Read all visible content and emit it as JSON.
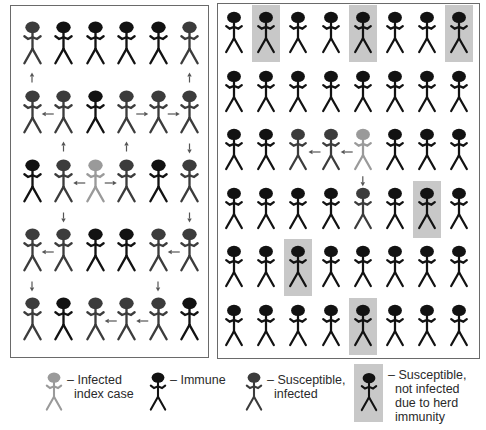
{
  "colors": {
    "immune": "#121212",
    "infected": "#3c3c3c",
    "index": "#9a9a9a",
    "shade": "#c8c8c8",
    "arrow": "#555555"
  },
  "left_panel": {
    "title": "Without herd immunity",
    "cols": 6,
    "rows": 5,
    "grid": [
      [
        "infected",
        "immune",
        "immune",
        "immune",
        "immune",
        "infected"
      ],
      [
        "infected",
        "infected",
        "immune",
        "infected",
        "infected",
        "infected"
      ],
      [
        "immune",
        "infected",
        "index",
        "infected",
        "immune",
        "infected"
      ],
      [
        "infected",
        "infected",
        "immune",
        "immune",
        "infected",
        "infected"
      ],
      [
        "infected",
        "immune",
        "infected",
        "infected",
        "infected",
        "immune"
      ]
    ],
    "arrows": [
      {
        "from": [
          1,
          0
        ],
        "to": [
          0,
          0
        ]
      },
      {
        "from": [
          1,
          5
        ],
        "to": [
          0,
          5
        ]
      },
      {
        "from": [
          1,
          1
        ],
        "to": [
          1,
          0
        ]
      },
      {
        "from": [
          1,
          3
        ],
        "to": [
          1,
          4
        ]
      },
      {
        "from": [
          1,
          4
        ],
        "to": [
          1,
          5
        ]
      },
      {
        "from": [
          2,
          1
        ],
        "to": [
          1,
          1
        ]
      },
      {
        "from": [
          2,
          3
        ],
        "to": [
          1,
          3
        ]
      },
      {
        "from": [
          1,
          5
        ],
        "to": [
          2,
          5
        ]
      },
      {
        "from": [
          2,
          2
        ],
        "to": [
          2,
          1
        ]
      },
      {
        "from": [
          2,
          2
        ],
        "to": [
          2,
          3
        ]
      },
      {
        "from": [
          2,
          1
        ],
        "to": [
          3,
          1
        ]
      },
      {
        "from": [
          2,
          5
        ],
        "to": [
          3,
          5
        ]
      },
      {
        "from": [
          3,
          1
        ],
        "to": [
          3,
          0
        ]
      },
      {
        "from": [
          3,
          5
        ],
        "to": [
          3,
          4
        ]
      },
      {
        "from": [
          3,
          0
        ],
        "to": [
          4,
          0
        ]
      },
      {
        "from": [
          3,
          4
        ],
        "to": [
          4,
          4
        ]
      },
      {
        "from": [
          4,
          4
        ],
        "to": [
          4,
          3
        ]
      },
      {
        "from": [
          4,
          3
        ],
        "to": [
          4,
          2
        ]
      }
    ]
  },
  "right_panel": {
    "title": "With herd immunity",
    "cols": 8,
    "rows": 6,
    "grid": [
      [
        "immune",
        "shaded",
        "immune",
        "immune",
        "shaded",
        "immune",
        "immune",
        "shaded"
      ],
      [
        "immune",
        "immune",
        "immune",
        "immune",
        "immune",
        "immune",
        "immune",
        "immune"
      ],
      [
        "immune",
        "immune",
        "infected",
        "infected",
        "index",
        "immune",
        "immune",
        "immune"
      ],
      [
        "immune",
        "immune",
        "immune",
        "immune",
        "infected",
        "immune",
        "shaded",
        "immune"
      ],
      [
        "immune",
        "immune",
        "shaded",
        "immune",
        "immune",
        "immune",
        "immune",
        "immune"
      ],
      [
        "immune",
        "immune",
        "immune",
        "immune",
        "shaded",
        "immune",
        "immune",
        "immune"
      ]
    ],
    "arrows": [
      {
        "from": [
          2,
          4
        ],
        "to": [
          2,
          3
        ]
      },
      {
        "from": [
          2,
          3
        ],
        "to": [
          2,
          2
        ]
      },
      {
        "from": [
          2,
          4
        ],
        "to": [
          3,
          4
        ]
      }
    ]
  },
  "legend": [
    {
      "type": "index",
      "label": "– Infected\n  index case"
    },
    {
      "type": "immune",
      "label": "– Immune"
    },
    {
      "type": "infected",
      "label": "– Susceptible,\n  infected"
    },
    {
      "type": "shaded",
      "label": "– Susceptible,\n  not infected\n  due to herd\n  immunity"
    }
  ]
}
